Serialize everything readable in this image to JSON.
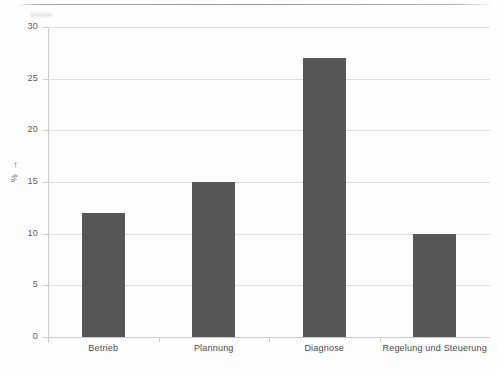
{
  "chart_data": {
    "type": "bar",
    "title": "",
    "subtitle": "",
    "xlabel": "",
    "ylabel": "% →",
    "categories": [
      "Betrieb",
      "Plannung",
      "Diagnose",
      "Regelung und Steuerung"
    ],
    "values": [
      12,
      15,
      27,
      10
    ],
    "series": [
      {
        "name": "",
        "values": [
          12,
          15,
          27,
          10
        ]
      }
    ],
    "ylim": [
      0,
      30
    ],
    "ytick_labels": [
      "0",
      "5",
      "10",
      "15",
      "20",
      "25",
      "30"
    ],
    "ytick_values": [
      0,
      5,
      10,
      15,
      20,
      25,
      30
    ],
    "grid": "horizontal",
    "legend": "none",
    "bar_color": "#565656",
    "gridline_color": "#dcdcdc",
    "axis_color": "#c9c9c9",
    "text_color": "#4a4a4a",
    "background_color": "#fdfdfd"
  }
}
